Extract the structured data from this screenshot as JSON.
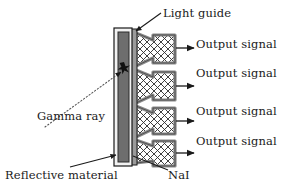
{
  "figure": {
    "background_color": "#ffffff",
    "ink_color": "#1a1a1a"
  },
  "labels": {
    "light_guide": "Light guide",
    "gamma_ray": "Gamma ray",
    "reflective_material": "Reflective material",
    "nai": "NaI",
    "output_signal": "Output signal"
  },
  "outputs": [
    {
      "label": "Output signal"
    },
    {
      "label": "Output signal"
    },
    {
      "label": "Output signal"
    },
    {
      "label": "Output signal"
    }
  ],
  "colors": {
    "crystal_fill": "#6e6e6e",
    "reflective_fill": "#f2f2f2",
    "light_guide_fill": "#9a9a9a",
    "pmt_border": "#8a8a8a",
    "pmt_hatch": "#2b2b2b",
    "outline": "#1a1a1a"
  },
  "components": {
    "crystal": "NaI",
    "wrapper": "Reflective material",
    "coupler": "Light guide",
    "sensors": "Photomultiplier tubes",
    "sensor_count": 4,
    "interaction_marker": "gamma-interaction-star"
  }
}
